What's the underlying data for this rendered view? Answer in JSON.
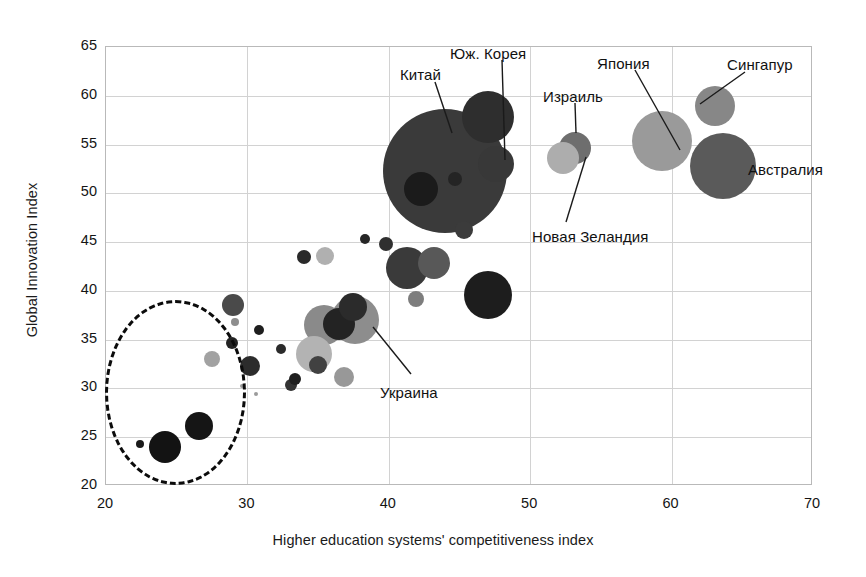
{
  "chart_data": {
    "type": "scatter",
    "title": "",
    "xlabel": "Higher education systems' competitiveness index",
    "ylabel": "Global Innovation Index",
    "xlim": [
      20,
      70
    ],
    "ylim": [
      20,
      65
    ],
    "xticks": [
      20,
      30,
      40,
      50,
      60,
      70
    ],
    "yticks": [
      20,
      25,
      30,
      35,
      40,
      45,
      50,
      55,
      60,
      65
    ],
    "grid": true,
    "legend": "none",
    "bubble_note": "Bubble area encodes a third (unlabelled) magnitude variable; greyscale shading varies per point.",
    "points": [
      {
        "label": "Китай",
        "x": 44.0,
        "y": 52.3,
        "r": 62,
        "color": "#3a3a3a",
        "labeled": true
      },
      {
        "label": "Юж. Корея",
        "x": 47.0,
        "y": 57.8,
        "r": 26,
        "color": "#2e2e2e",
        "labeled": true
      },
      {
        "label": "",
        "x": 47.6,
        "y": 53.0,
        "r": 18,
        "color": "#383838",
        "labeled": false
      },
      {
        "label": "",
        "x": 42.3,
        "y": 50.4,
        "r": 17,
        "color": "#1b1b1b",
        "labeled": false
      },
      {
        "label": "",
        "x": 44.7,
        "y": 51.5,
        "r": 7,
        "color": "#242424",
        "labeled": false
      },
      {
        "label": "Израиль",
        "x": 53.2,
        "y": 54.6,
        "r": 16,
        "color": "#6e6e6e",
        "labeled": true
      },
      {
        "label": "Новая Зеландия",
        "x": 52.3,
        "y": 53.6,
        "r": 16,
        "color": "#adadad",
        "labeled": true
      },
      {
        "label": "Япония",
        "x": 59.3,
        "y": 55.4,
        "r": 30,
        "color": "#9a9a9a",
        "labeled": true
      },
      {
        "label": "Сингапур",
        "x": 63.1,
        "y": 59.0,
        "r": 20,
        "color": "#878787",
        "labeled": true
      },
      {
        "label": "Австралия",
        "x": 63.6,
        "y": 52.8,
        "r": 33,
        "color": "#5a5a5a",
        "labeled": true
      },
      {
        "label": "Украина",
        "x": 37.6,
        "y": 37.0,
        "r": 24,
        "color": "#8d8d8d",
        "labeled": true
      },
      {
        "label": "",
        "x": 45.3,
        "y": 46.2,
        "r": 9,
        "color": "#3b3b3b",
        "labeled": false
      },
      {
        "label": "",
        "x": 47.0,
        "y": 39.6,
        "r": 24,
        "color": "#1d1d1d",
        "labeled": false
      },
      {
        "label": "",
        "x": 41.3,
        "y": 42.3,
        "r": 21,
        "color": "#3a3a3a",
        "labeled": false
      },
      {
        "label": "",
        "x": 43.2,
        "y": 42.9,
        "r": 16,
        "color": "#585858",
        "labeled": false
      },
      {
        "label": "",
        "x": 39.8,
        "y": 44.8,
        "r": 7,
        "color": "#2f2f2f",
        "labeled": false
      },
      {
        "label": "",
        "x": 37.5,
        "y": 38.3,
        "r": 14,
        "color": "#2b2b2b",
        "labeled": false
      },
      {
        "label": "",
        "x": 35.4,
        "y": 36.5,
        "r": 20,
        "color": "#8a8a8a",
        "labeled": false
      },
      {
        "label": "",
        "x": 36.5,
        "y": 36.6,
        "r": 16,
        "color": "#232323",
        "labeled": false
      },
      {
        "label": "",
        "x": 34.0,
        "y": 43.5,
        "r": 7,
        "color": "#2a2a2a",
        "labeled": false
      },
      {
        "label": "",
        "x": 35.5,
        "y": 43.6,
        "r": 9,
        "color": "#b0b0b0",
        "labeled": false
      },
      {
        "label": "",
        "x": 38.3,
        "y": 45.3,
        "r": 5,
        "color": "#262626",
        "labeled": false
      },
      {
        "label": "",
        "x": 41.9,
        "y": 39.2,
        "r": 8,
        "color": "#7d7d7d",
        "labeled": false
      },
      {
        "label": "",
        "x": 34.7,
        "y": 33.5,
        "r": 18,
        "color": "#b3b3b3",
        "labeled": false
      },
      {
        "label": "",
        "x": 35.0,
        "y": 32.4,
        "r": 9,
        "color": "#414141",
        "labeled": false
      },
      {
        "label": "",
        "x": 36.8,
        "y": 31.2,
        "r": 10,
        "color": "#989898",
        "labeled": false
      },
      {
        "label": "",
        "x": 33.1,
        "y": 30.4,
        "r": 6,
        "color": "#333333",
        "labeled": false
      },
      {
        "label": "",
        "x": 33.4,
        "y": 31.0,
        "r": 6,
        "color": "#1f1f1f",
        "labeled": false
      },
      {
        "label": "",
        "x": 32.4,
        "y": 34.0,
        "r": 5,
        "color": "#2b2b2b",
        "labeled": false
      },
      {
        "label": "",
        "x": 30.2,
        "y": 32.3,
        "r": 10,
        "color": "#2c2c2c",
        "labeled": false
      },
      {
        "label": "",
        "x": 30.8,
        "y": 36.0,
        "r": 5,
        "color": "#1e1e1e",
        "labeled": false
      },
      {
        "label": "",
        "x": 29.0,
        "y": 38.6,
        "r": 11,
        "color": "#4a4a4a",
        "labeled": false
      },
      {
        "label": "",
        "x": 29.1,
        "y": 36.8,
        "r": 4,
        "color": "#8e8e8e",
        "labeled": false
      },
      {
        "label": "",
        "x": 28.9,
        "y": 34.7,
        "r": 6,
        "color": "#232323",
        "labeled": false
      },
      {
        "label": "",
        "x": 27.5,
        "y": 33.0,
        "r": 8,
        "color": "#a2a2a2",
        "labeled": false
      },
      {
        "label": "",
        "x": 26.6,
        "y": 26.2,
        "r": 14,
        "color": "#151515",
        "labeled": false
      },
      {
        "label": "",
        "x": 24.2,
        "y": 24.0,
        "r": 16,
        "color": "#131313",
        "labeled": false
      },
      {
        "label": "",
        "x": 22.4,
        "y": 24.3,
        "r": 4,
        "color": "#1a1a1a",
        "labeled": false
      },
      {
        "label": "",
        "x": 29.6,
        "y": 30.3,
        "r": 2,
        "color": "#9b9b9b",
        "labeled": false
      },
      {
        "label": "",
        "x": 30.6,
        "y": 29.4,
        "r": 2,
        "color": "#9b9b9b",
        "labeled": false
      }
    ],
    "highlight_ellipse": {
      "label": "",
      "cx": 24.9,
      "cy": 29.6,
      "rx": 5.0,
      "ry": 9.5,
      "style": "dashed",
      "color": "#0b0b0b"
    }
  },
  "callouts": [
    {
      "label": "Китай",
      "lx": 400,
      "ly": 66,
      "anchor": "start",
      "line": [
        435,
        82,
        452,
        133
      ]
    },
    {
      "label": "Юж. Корея",
      "lx": 450,
      "ly": 45,
      "anchor": "start",
      "line": [
        502,
        60,
        505,
        160
      ]
    },
    {
      "label": "Израиль",
      "lx": 543,
      "ly": 88,
      "anchor": "start",
      "line": [
        575,
        103,
        576,
        133
      ]
    },
    {
      "label": "Япония",
      "lx": 597,
      "ly": 55,
      "anchor": "start",
      "line": [
        635,
        70,
        680,
        150
      ]
    },
    {
      "label": "Сингапур",
      "lx": 727,
      "ly": 56,
      "anchor": "start",
      "line": [
        745,
        72,
        700,
        104
      ]
    },
    {
      "label": "Австралия",
      "lx": 748,
      "ly": 161,
      "anchor": "start",
      "line": [
        0,
        0,
        0,
        0
      ]
    },
    {
      "label": "Новая Зеландия",
      "lx": 532,
      "ly": 228,
      "anchor": "start",
      "line": [
        566,
        222,
        586,
        157
      ]
    },
    {
      "label": "Украина",
      "lx": 380,
      "ly": 384,
      "anchor": "start",
      "line": [
        411,
        374,
        373,
        327
      ]
    }
  ],
  "axes": {
    "y_ticks": [
      "65",
      "60",
      "55",
      "50",
      "45",
      "40",
      "35",
      "30",
      "25",
      "20"
    ],
    "x_ticks": [
      "20",
      "30",
      "40",
      "50",
      "60",
      "70"
    ],
    "x_title": "Higher education systems' competitiveness index",
    "y_title": "Global Innovation Index"
  }
}
